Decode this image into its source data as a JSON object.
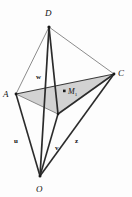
{
  "figure": {
    "background_color": "#fdfdfd",
    "shaded_face_fill": "#d2d2d2",
    "line_color": "#2b2b2b",
    "thin_line_color": "#707070",
    "vertices": [
      {
        "id": "D",
        "label": "D",
        "x": 49,
        "y": 27,
        "label_x": 45,
        "label_y": 16
      },
      {
        "id": "C",
        "label": "C",
        "x": 114,
        "y": 74,
        "label_x": 117,
        "label_y": 74
      },
      {
        "id": "A",
        "label": "A",
        "x": 16,
        "y": 94,
        "label_x": 4,
        "label_y": 96
      },
      {
        "id": "B",
        "label": "",
        "x": 58,
        "y": 114,
        "label_x": 58,
        "label_y": 114
      },
      {
        "id": "O",
        "label": "O",
        "x": 40,
        "y": 176,
        "label_x": 36,
        "label_y": 191
      }
    ],
    "interior_points": [
      {
        "id": "M1",
        "label": "M",
        "subscript": "1",
        "x": 70,
        "y": 92,
        "dot_x": 64,
        "dot_y": 91
      }
    ],
    "vector_labels": [
      {
        "id": "w",
        "label": "w",
        "x": 38,
        "y": 76,
        "from": "A",
        "to": "D"
      },
      {
        "id": "u",
        "label": "u",
        "x": 16,
        "y": 140,
        "from": "O",
        "to": "A"
      },
      {
        "id": "v",
        "label": "v",
        "x": 56,
        "y": 147,
        "from": "O",
        "to": "B"
      },
      {
        "id": "z",
        "label": "z",
        "x": 76,
        "y": 140,
        "from": "O",
        "to": "C"
      }
    ],
    "edges": [
      {
        "id": "A-D",
        "from": "A",
        "to": "D",
        "weight": "thin"
      },
      {
        "id": "D-C",
        "from": "D",
        "to": "C",
        "weight": "thin"
      },
      {
        "id": "A-C",
        "from": "A",
        "to": "C",
        "weight": "medium"
      },
      {
        "id": "A-B",
        "from": "A",
        "to": "B",
        "weight": "thin"
      },
      {
        "id": "B-C",
        "from": "B",
        "to": "C",
        "weight": "medium"
      },
      {
        "id": "D-B",
        "from": "D",
        "to": "B",
        "weight": "thick"
      },
      {
        "id": "D-O",
        "from": "D",
        "to": "O",
        "weight": "thick"
      },
      {
        "id": "O-A",
        "from": "O",
        "to": "A",
        "weight": "thick"
      },
      {
        "id": "O-B",
        "from": "O",
        "to": "B",
        "weight": "thick"
      },
      {
        "id": "O-C",
        "from": "O",
        "to": "C",
        "weight": "thick"
      }
    ],
    "shaded_face": {
      "id": "triangle-ABC",
      "vertices": [
        "A",
        "B",
        "C"
      ]
    }
  }
}
